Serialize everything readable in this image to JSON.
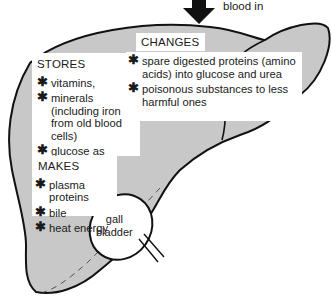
{
  "colors": {
    "liver_fill": "#c8c8c8",
    "outline": "#111111",
    "box_bg": "#ffffff",
    "text": "#1a1a1a"
  },
  "arrow": {
    "label": "blood in",
    "icon": "down-arrow-icon"
  },
  "stores": {
    "title": "STORES",
    "items": [
      {
        "bullet": "✱",
        "text": "vitamins,"
      },
      {
        "bullet": "✱",
        "text": "minerals (including iron from old blood cells)"
      },
      {
        "bullet": "✱",
        "text": "glucose as glycogen"
      }
    ]
  },
  "changes": {
    "title": "CHANGES",
    "items": [
      {
        "bullet": "✱",
        "text": "spare digested proteins (amino acids) into glucose and urea"
      },
      {
        "bullet": "✱",
        "text": "poisonous substances to less harmful ones"
      }
    ]
  },
  "makes": {
    "title": "MAKES",
    "items": [
      {
        "bullet": "✱",
        "text": "plasma proteins"
      },
      {
        "bullet": "✱",
        "text": "bile"
      },
      {
        "bullet": "✱",
        "text": "heat energy"
      }
    ]
  },
  "gall_bladder": {
    "line1": "gall",
    "line2": "bladder"
  }
}
